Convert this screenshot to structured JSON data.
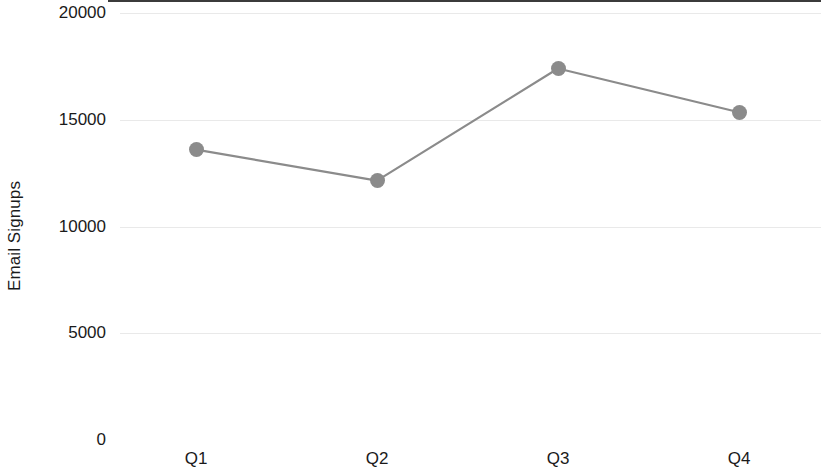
{
  "chart_data": {
    "type": "line",
    "title": "",
    "subtitle": "",
    "xlabel": "",
    "ylabel": "Email Signups",
    "categories": [
      "Q1",
      "Q2",
      "Q3",
      "Q4"
    ],
    "values": [
      13600,
      12150,
      17400,
      15350
    ],
    "series": [
      {
        "name": "Email Signups",
        "values": [
          13600,
          12150,
          17400,
          15350
        ]
      }
    ],
    "ylim": [
      0,
      20000
    ],
    "y_ticks": [
      0,
      5000,
      10000,
      15000,
      20000
    ],
    "y_tick_labels": [
      "0",
      "5000",
      "10000",
      "15000",
      "20000"
    ],
    "x_tick_labels": [
      "Q1",
      "Q2",
      "Q3",
      "Q4"
    ],
    "grid": true,
    "grid_axis": "y",
    "legend": false,
    "legend_position": "none",
    "marker": "circle",
    "colors": {
      "line": "#8b8b8b",
      "marker": "#8b8b8b",
      "gridline": "#e9e9e9",
      "axis": "#3b3b3b",
      "text": "#1a1a1a",
      "background": "#ffffff"
    }
  },
  "axes": {
    "y_title": "Email Signups",
    "y_ticks": [
      {
        "label": "20000",
        "value": 20000
      },
      {
        "label": "15000",
        "value": 15000
      },
      {
        "label": "10000",
        "value": 10000
      },
      {
        "label": "5000",
        "value": 5000
      },
      {
        "label": "0",
        "value": 0
      }
    ],
    "x_ticks": [
      {
        "label": "Q1"
      },
      {
        "label": "Q2"
      },
      {
        "label": "Q3"
      },
      {
        "label": "Q4"
      }
    ]
  }
}
